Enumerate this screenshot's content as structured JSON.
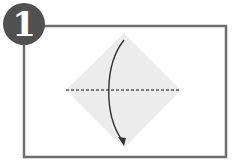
{
  "step": {
    "number": "1"
  },
  "colors": {
    "frame": "#6e6e6e",
    "badge": "#505050",
    "paper": "#ececec",
    "crease": "#555555",
    "arrow": "#333333"
  },
  "diagram": {
    "paper_shape": "diamond",
    "fold_line": "horizontal dashed valley fold",
    "arrow": "curved arrow top corner to bottom corner"
  }
}
